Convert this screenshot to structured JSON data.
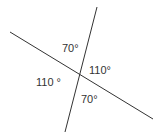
{
  "diagram": {
    "type": "intersecting-lines-angles",
    "line_color": "#333333",
    "text_color": "#333333",
    "lines": [
      {
        "x1": 10,
        "y1": 32,
        "x2": 153,
        "y2": 119
      },
      {
        "x1": 97,
        "y1": 7,
        "x2": 65,
        "y2": 132
      }
    ],
    "angles": [
      {
        "label": "70°",
        "position": "top"
      },
      {
        "label": "110°",
        "position": "right"
      },
      {
        "label": "110 °",
        "position": "left"
      },
      {
        "label": "70°",
        "position": "bottom"
      }
    ]
  }
}
